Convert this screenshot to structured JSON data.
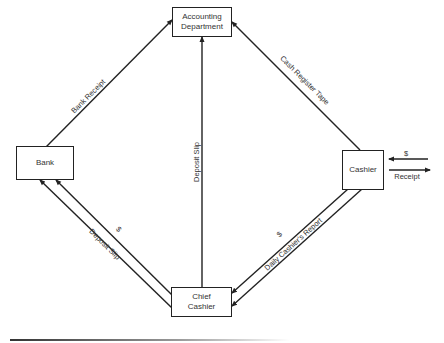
{
  "diagram": {
    "type": "flow",
    "nodes": [
      {
        "id": "accounting",
        "label": "Accounting Department",
        "line1": "Accounting",
        "line2": "Department"
      },
      {
        "id": "bank",
        "label": "Bank"
      },
      {
        "id": "cashier",
        "label": "Cashier"
      },
      {
        "id": "chief",
        "label": "Chief Cashier",
        "line1": "Chief",
        "line2": "Cashier"
      }
    ],
    "edges": [
      {
        "from": "bank",
        "to": "accounting",
        "label": "Bank Receipt"
      },
      {
        "from": "cashier",
        "to": "accounting",
        "label": "Cash Register Tape"
      },
      {
        "from": "chief",
        "to": "accounting",
        "label": "Deposit Slip"
      },
      {
        "from": "chief",
        "to": "bank",
        "label": "$"
      },
      {
        "from": "chief",
        "to": "bank",
        "label": "Deposit Slip"
      },
      {
        "from": "cashier",
        "to": "chief",
        "label": "$"
      },
      {
        "from": "cashier",
        "to": "chief",
        "label": "Daily Cashier's Report"
      },
      {
        "from": "external",
        "to": "cashier",
        "label": "$"
      },
      {
        "from": "cashier",
        "to": "external",
        "label": "Receipt"
      }
    ]
  },
  "labels": {
    "bank_receipt": "Bank Receipt",
    "cash_register_tape": "Cash Register Tape",
    "deposit_slip_vertical": "Deposit Slip",
    "deposit_slip_bank": "Deposit Slip",
    "dollar_bank": "$",
    "dollar_chief": "$",
    "daily_report": "Daily Cashier's Report",
    "dollar_in": "$",
    "receipt_out": "Receipt"
  }
}
